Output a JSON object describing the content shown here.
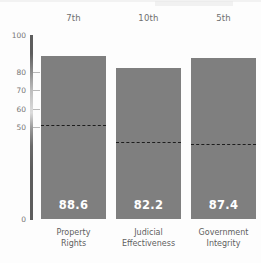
{
  "chart_data": {
    "type": "bar",
    "title": "",
    "subtitle": "",
    "xlabel": "",
    "ylabel": "",
    "ylim": [
      0,
      100
    ],
    "grid": false,
    "legend_position": "none",
    "categories": [
      "Property Rights",
      "Judicial Effectiveness",
      "Government Integrity"
    ],
    "category_lines": [
      [
        "Property",
        "Rights"
      ],
      [
        "Judicial",
        "Effectiveness"
      ],
      [
        "Government",
        "Integrity"
      ]
    ],
    "values": [
      88.6,
      82.2,
      87.4
    ],
    "value_labels": [
      "88.6",
      "82.2",
      "87.4"
    ],
    "ranks": [
      "7th",
      "10th",
      "5th"
    ],
    "reference_lines": {
      "name": "world average",
      "values": [
        51.0,
        42.0,
        41.0
      ],
      "style": "dashed"
    },
    "yticks": [
      100,
      80,
      70,
      60,
      50,
      0
    ],
    "ytick_labels": [
      "100",
      "80",
      "70",
      "60",
      "50",
      "0"
    ],
    "colors": {
      "bar": "#7f7f7f",
      "value_label": "#ffffff",
      "reference_line": "#1d1d1d",
      "axis": "#5d5d5d",
      "tick_label": "#767676",
      "category_label": "#5f5f5f",
      "rank_label": "#6f6f6f",
      "background": "#fdfdfd"
    }
  }
}
